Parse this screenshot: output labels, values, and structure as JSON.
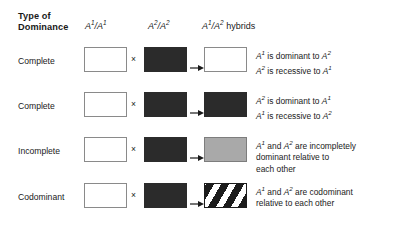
{
  "figure": {
    "header": {
      "type_label_line1": "Type of",
      "type_label_line2": "Dominance",
      "col1": "A1/A1",
      "col2": "A2/A2",
      "col3": "A1/A2 hybrids"
    },
    "cross_symbol": "×",
    "arrow_symbol": "→",
    "colors": {
      "white": "#ffffff",
      "dark": "#2b2b2b",
      "gray": "#a9a9a9",
      "stripe_dark": "#1c1c1c",
      "box_border": "#8a8a8a",
      "text": "#1a1a1a"
    },
    "rows": [
      {
        "label": "Complete",
        "parent1_fill": "white",
        "parent2_fill": "dark",
        "hybrid_fill": "white",
        "description_lines": [
          "A1 is dominant to A2",
          "A2 is recessive to A1"
        ]
      },
      {
        "label": "Complete",
        "parent1_fill": "white",
        "parent2_fill": "dark",
        "hybrid_fill": "dark",
        "description_lines": [
          "A2 is dominant to A1",
          "A1 is recessive to A2"
        ]
      },
      {
        "label": "Incomplete",
        "parent1_fill": "white",
        "parent2_fill": "dark",
        "hybrid_fill": "gray",
        "description_lines": [
          "A1 and A2 are incompletely",
          "dominant relative to",
          "each other"
        ]
      },
      {
        "label": "Codominant",
        "parent1_fill": "white",
        "parent2_fill": "dark",
        "hybrid_fill": "striped",
        "description_lines": [
          "A1 and A2 are codominant",
          "relative to each other"
        ]
      }
    ]
  }
}
